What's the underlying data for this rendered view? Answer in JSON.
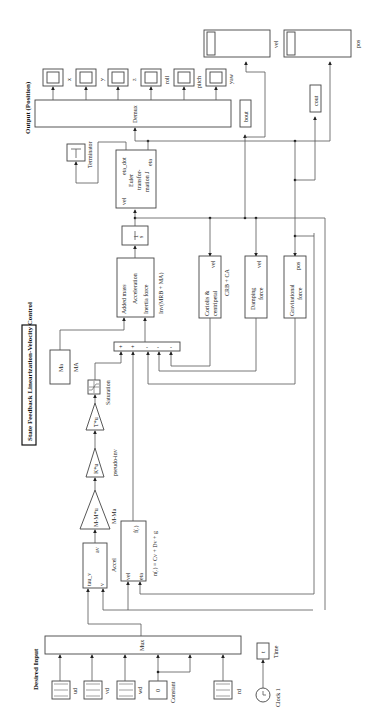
{
  "diagram": {
    "title": "State Feedback Linearization-Velocity Control",
    "sections": {
      "input": "Desired Input",
      "output": "Output (Position)"
    },
    "sources": [
      {
        "id": "ud",
        "label": "ud"
      },
      {
        "id": "vd",
        "label": "vd"
      },
      {
        "id": "wd",
        "label": "wd"
      },
      {
        "id": "constant",
        "label": "Constant",
        "value": "0"
      },
      {
        "id": "rd",
        "label": "rd"
      }
    ],
    "clock": {
      "label": "Clock 1",
      "display_label": "Time",
      "display_value": "t"
    },
    "mux": {
      "label": "Mux"
    },
    "accel": {
      "label": "Accel",
      "ports_in": [
        "tau_v",
        "v"
      ],
      "port_out": "av"
    },
    "gain_mma": {
      "expr": "M-M*u",
      "label": "M-Ma"
    },
    "gain_pinv": {
      "expr": "K*u",
      "label": "pseudo-inv"
    },
    "gain_t": {
      "expr": "T*u"
    },
    "saturation": {
      "label": "Saturation"
    },
    "fcn": {
      "expr": "f(.)",
      "ports_in": [
        "vel",
        "eta"
      ],
      "label": "n(.) = Cv + Dv + g"
    },
    "ma": {
      "value": "Ma",
      "label": "MA"
    },
    "sum": {
      "signs": [
        "+",
        "+",
        "-",
        "-",
        "-"
      ]
    },
    "inertia": {
      "lines": [
        "Added mass",
        "Acceleration",
        "Inertia force"
      ],
      "label": "Inv(MRB + MA)"
    },
    "integrator": {
      "num": "1",
      "den": "s"
    },
    "euler": {
      "port_in": "vel",
      "port_out_top": "eta_dot",
      "port_out_bottom": "eta",
      "lines": [
        "Euler",
        "transfor-",
        "mation J"
      ]
    },
    "terminator": {
      "label": "Terminator"
    },
    "demux": {
      "label": "Demux"
    },
    "scopes": [
      {
        "label": "x"
      },
      {
        "label": "y"
      },
      {
        "label": "z"
      },
      {
        "label": "roll"
      },
      {
        "label": "pitch"
      },
      {
        "label": "yaw"
      }
    ],
    "coriolis": {
      "lines": [
        "Coriolis &",
        "centripetal"
      ],
      "port": "vel",
      "label": "CRB + CA"
    },
    "damping": {
      "lines": [
        "Damping",
        "force"
      ],
      "port": "vel"
    },
    "gravity": {
      "lines": [
        "Gravitational",
        "force"
      ],
      "port": "pos"
    },
    "workspace": [
      {
        "label": "bout"
      },
      {
        "label": "cout"
      }
    ],
    "big_scopes": [
      {
        "label": "vel"
      },
      {
        "label": "pos"
      }
    ]
  }
}
